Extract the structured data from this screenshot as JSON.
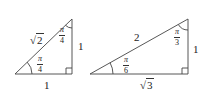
{
  "diagram": {
    "triangles": [
      {
        "name": "45-45-90 triangle",
        "hypotenuse": "√2",
        "hypotenuse_radicand": "2",
        "legs": [
          "1",
          "1"
        ],
        "angles": [
          {
            "position": "bottom-left",
            "numerator": "π",
            "denominator": "4"
          },
          {
            "position": "top",
            "numerator": "π",
            "denominator": "4"
          }
        ],
        "right_angle": "bottom-right"
      },
      {
        "name": "30-60-90 triangle",
        "hypotenuse": "2",
        "bottom_leg": "√3",
        "bottom_leg_radicand": "3",
        "right_leg": "1",
        "angles": [
          {
            "position": "bottom-left",
            "numerator": "π",
            "denominator": "6"
          },
          {
            "position": "top",
            "numerator": "π",
            "denominator": "3"
          }
        ],
        "right_angle": "bottom-right"
      }
    ],
    "colors": {
      "stroke": "#333333",
      "background": "#ffffff"
    }
  }
}
